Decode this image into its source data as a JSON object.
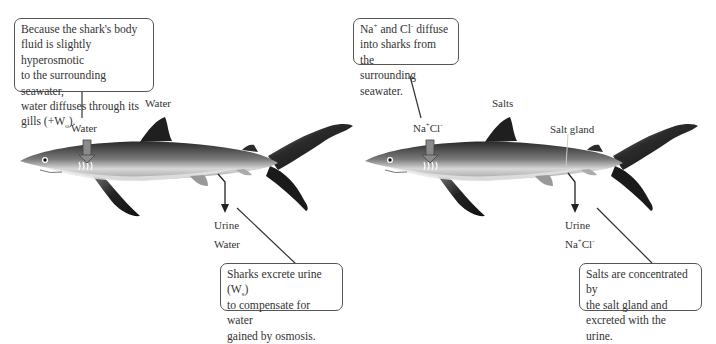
{
  "panels": [
    {
      "id": "water-balance",
      "top_box": {
        "lines": [
          "Because the shark's body",
          "fluid is slightly hyperosmotic",
          "to the surrounding seawater,",
          "water diffuses through its"
        ],
        "last_line_prefix": "gills (+W",
        "last_line_sub": "o",
        "last_line_suffix": ")."
      },
      "header_label": "Water",
      "gill_label": "Water",
      "urine_label": "Urine",
      "urine_content_label": "Water",
      "bottom_box": {
        "line1_prefix": "Sharks excrete urine (W",
        "line1_sub": "s",
        "line1_suffix": ")",
        "lines": [
          "to compensate for water",
          "gained by osmosis."
        ]
      }
    },
    {
      "id": "salt-balance",
      "top_box": {
        "na": "Na",
        "na_sup": "+",
        "and": " and Cl",
        "cl_sup": "-",
        "rest": " diffuse",
        "lines": [
          "into sharks from the",
          "surrounding seawater."
        ]
      },
      "header_label": "Salts",
      "gill_label": {
        "na": "Na",
        "na_sup": "+",
        "cl": "Cl",
        "cl_sup": "-"
      },
      "salt_gland_label": "Salt gland",
      "urine_label": "Urine",
      "urine_content_label": {
        "na": "Na",
        "na_sup": "+",
        "cl": "Cl",
        "cl_sup": "-"
      },
      "bottom_box": {
        "lines": [
          "Salts are concentrated by",
          "the salt gland and",
          "excreted with the urine."
        ]
      }
    }
  ],
  "colors": {
    "text": "#333333",
    "box_border": "#555555",
    "shark_dark": "#1f1f1f",
    "shark_mid": "#6b6b6b",
    "shark_belly": "#e8e8e8",
    "arrow_fill": "#8a8a8a"
  }
}
